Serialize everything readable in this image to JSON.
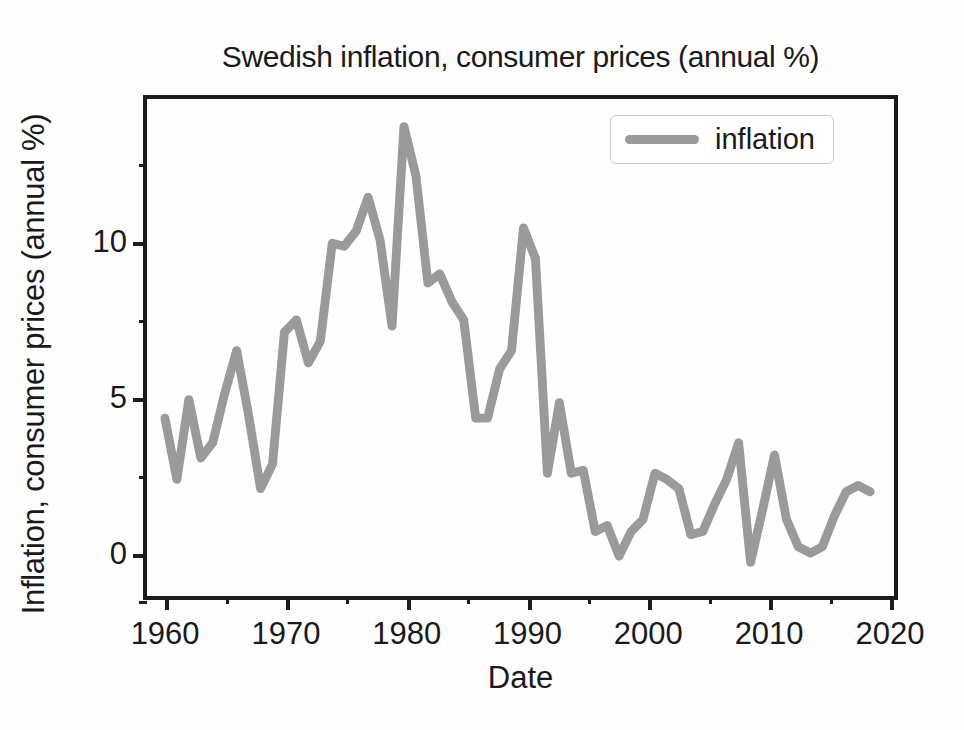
{
  "chart_data": {
    "type": "line",
    "title": "Swedish inflation, consumer prices (annual %)",
    "xlabel": "Date",
    "ylabel": "Inflation, consumer prices (annual %)",
    "legend": [
      "inflation"
    ],
    "legend_position": "upper right",
    "grid": false,
    "line_color": "#9a9a9a",
    "frame_color": "#1c1c1c",
    "background_color": "#fefefe",
    "xlim": [
      1958.5,
      2021.0
    ],
    "ylim": [
      -1.6,
      14.6
    ],
    "xticks": [
      1960,
      1970,
      1980,
      1990,
      2000,
      2010,
      2020
    ],
    "xtick_labels": [
      "1960",
      "1970",
      "1980",
      "1990",
      "2000",
      "2010",
      "2020"
    ],
    "xticks_minor": [
      1965,
      1975,
      1985,
      1995,
      2005,
      2015
    ],
    "yticks": [
      0,
      5,
      10
    ],
    "ytick_labels": [
      "0",
      "5",
      "10"
    ],
    "yticks_minor": [
      -1.5,
      2.5,
      7.5,
      12.5
    ],
    "x": [
      1960,
      1961,
      1962,
      1963,
      1964,
      1965,
      1966,
      1967,
      1968,
      1969,
      1970,
      1971,
      1972,
      1973,
      1974,
      1975,
      1976,
      1977,
      1978,
      1979,
      1980,
      1981,
      1982,
      1983,
      1984,
      1985,
      1986,
      1987,
      1988,
      1989,
      1990,
      1991,
      1992,
      1993,
      1994,
      1995,
      1996,
      1997,
      1998,
      1999,
      2000,
      2001,
      2002,
      2003,
      2004,
      2005,
      2006,
      2007,
      2008,
      2009,
      2010,
      2011,
      2012,
      2013,
      2014,
      2015,
      2016,
      2017,
      2018,
      2019
    ],
    "series": [
      {
        "name": "inflation",
        "values": [
          4.2,
          2.2,
          4.8,
          2.9,
          3.4,
          5.0,
          6.4,
          4.3,
          1.9,
          2.7,
          7.0,
          7.4,
          6.0,
          6.7,
          9.9,
          9.8,
          10.3,
          11.4,
          10.0,
          7.2,
          13.7,
          12.1,
          8.6,
          8.9,
          8.0,
          7.4,
          4.2,
          4.2,
          5.8,
          6.4,
          10.4,
          9.4,
          2.4,
          4.7,
          2.4,
          2.5,
          0.5,
          0.7,
          -0.3,
          0.5,
          0.9,
          2.4,
          2.2,
          1.9,
          0.4,
          0.5,
          1.4,
          2.2,
          3.4,
          -0.5,
          1.2,
          3.0,
          0.9,
          0.0,
          -0.2,
          0.0,
          1.0,
          1.8,
          2.0,
          1.8
        ]
      }
    ]
  }
}
